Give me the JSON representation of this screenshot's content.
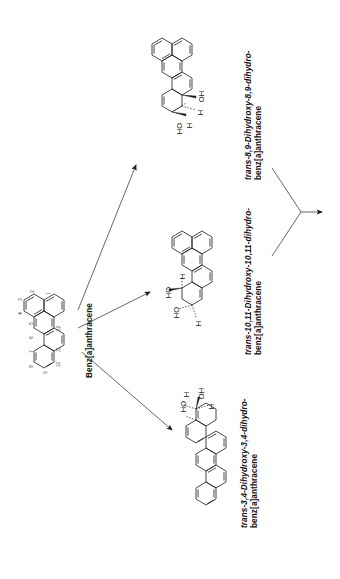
{
  "diagram": {
    "type": "reaction-scheme",
    "orientation": "rotated-90-ccw",
    "background_color": "#ffffff",
    "line_color": "#1a1a1a"
  },
  "reactant": {
    "name": "Benz[a]anthracene",
    "label_id": "benz-a-anthracene-label",
    "ring_position_numbers": [
      "1",
      "2",
      "3",
      "4",
      "5",
      "6",
      "7",
      "8",
      "9",
      "10",
      "11",
      "12"
    ]
  },
  "products": [
    {
      "id": "product-8-9-diol",
      "name_line1": "trans-8,9-Dihydroxy-8,9-dihydro-",
      "name_line2": "benz[a]anthracene",
      "italic_prefix": "trans-",
      "substituents": [
        "OH",
        "H",
        "H",
        "HO"
      ]
    },
    {
      "id": "product-10-11-diol",
      "name_line1": "trans-10,11-Dihydroxy-10,11-dihydro-",
      "name_line2": "benz[a]anthracene",
      "italic_prefix": "trans-",
      "substituents": [
        "H",
        "HO",
        "HO",
        "H"
      ]
    },
    {
      "id": "product-3-4-diol",
      "name_line1": "trans-3,4-Dihydroxy-3,4-dihydro-",
      "name_line2": "benz[a]anthracene",
      "italic_prefix": "trans-",
      "substituents": [
        "HO",
        "H",
        "OH",
        "H"
      ]
    }
  ],
  "arrows": {
    "branching": [
      {
        "id": "arrow-to-8-9-diol",
        "direction": "up-right"
      },
      {
        "id": "arrow-to-10-11-diol",
        "direction": "right-up"
      },
      {
        "id": "arrow-to-3-4-diol",
        "direction": "down-right"
      }
    ],
    "converging": {
      "id": "arrow-convergent-outlet",
      "direction": "right",
      "branch_count": 2
    }
  }
}
